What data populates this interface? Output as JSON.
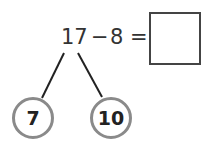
{
  "equation": {
    "minuend": "17",
    "operator": "−",
    "subtrahend": "8",
    "equals": "=",
    "answer": ""
  },
  "number_bond": {
    "parts": [
      "7",
      "10"
    ],
    "line_color": "#222222",
    "circle_border_color": "#8a8a8a"
  }
}
